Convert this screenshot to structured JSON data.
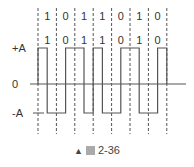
{
  "figure": {
    "bits": [
      "1",
      "0",
      "1",
      "1",
      "0",
      "1",
      "0"
    ],
    "labels": {
      "plus_a": "+A",
      "zero": "0",
      "minus_a": "-A"
    },
    "encoding": "manchester",
    "colors": {
      "line": "#555555",
      "dash": "#555555",
      "text": "#333333"
    }
  },
  "caption": {
    "marker": "▲",
    "label": "2-36"
  }
}
